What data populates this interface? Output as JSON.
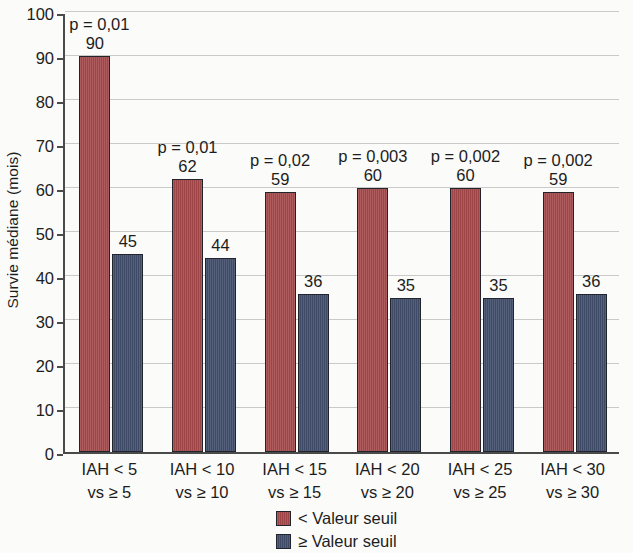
{
  "chart_data": {
    "type": "bar",
    "title": "",
    "xlabel": "",
    "ylabel": "Survie médiane (mois)",
    "ylim": [
      0,
      100
    ],
    "ytick_step": 10,
    "yticks": [
      "0",
      "10",
      "20",
      "30",
      "40",
      "50",
      "60",
      "70",
      "80",
      "90",
      "100"
    ],
    "grid": "horizontal",
    "legend_position": "bottom-center",
    "categories": [
      "IAH < 5\nvs ≥ 5",
      "IAH < 10\nvs ≥ 10",
      "IAH < 15\nvs ≥ 15",
      "IAH < 20\nvs ≥ 20",
      "IAH < 25\nvs ≥ 25",
      "IAH < 30\nvs ≥ 30"
    ],
    "category_lines": [
      {
        "line1": "IAH < 5",
        "line2": "vs ≥ 5"
      },
      {
        "line1": "IAH < 10",
        "line2": "vs ≥ 10"
      },
      {
        "line1": "IAH < 15",
        "line2": "vs ≥ 15"
      },
      {
        "line1": "IAH < 20",
        "line2": "vs ≥ 20"
      },
      {
        "line1": "IAH < 25",
        "line2": "vs ≥ 25"
      },
      {
        "line1": "IAH < 30",
        "line2": "vs ≥ 30"
      }
    ],
    "series": [
      {
        "name": "< Valeur seuil",
        "color": "#a5494b",
        "values": [
          90,
          62,
          59,
          60,
          60,
          59
        ],
        "value_labels": [
          "90",
          "62",
          "59",
          "60",
          "60",
          "59"
        ]
      },
      {
        "name": "≥ Valeur seuil",
        "color": "#44516e",
        "values": [
          45,
          44,
          36,
          35,
          35,
          36
        ],
        "value_labels": [
          "45",
          "44",
          "36",
          "35",
          "35",
          "36"
        ]
      }
    ],
    "annotations": {
      "p_values": [
        "p = 0,01",
        "p = 0,01",
        "p = 0,02",
        "p = 0,003",
        "p = 0,002",
        "p = 0,002"
      ]
    }
  },
  "legend": {
    "items": [
      {
        "label": "< Valeur seuil",
        "color": "#a5494b"
      },
      {
        "label": "≥ Valeur seuil",
        "color": "#44516e"
      }
    ]
  },
  "colors": {
    "series_low": "#a5494b",
    "series_high": "#44516e",
    "axis": "#4a4a4a",
    "grid": "#c9c9c9",
    "background": "#fbfbf9",
    "text": "#1d1d1d"
  }
}
